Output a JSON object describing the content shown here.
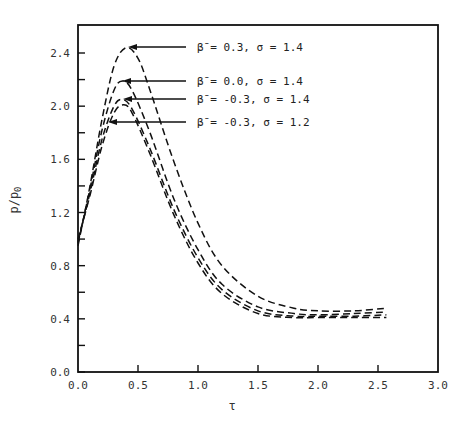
{
  "chart_data": {
    "type": "line",
    "title": "",
    "xlabel": "τ",
    "ylabel": "p/p0",
    "xlim": [
      0.0,
      3.0
    ],
    "ylim": [
      0.0,
      2.6
    ],
    "grid": false,
    "legend_position": "annotations with arrows, upper right",
    "x_ticks": [
      "0.0",
      "0.5",
      "1.0",
      "1.5",
      "2.0",
      "2.5",
      "3.0"
    ],
    "y_ticks": [
      "0.0",
      "0.4",
      "0.8",
      "1.2",
      "1.6",
      "2.0",
      "2.4"
    ],
    "line_style": "dashed",
    "series": [
      {
        "name": "β̄ = 0.3, σ = 1.4",
        "beta": 0.3,
        "sigma": 1.4,
        "x": [
          0.0,
          0.1,
          0.2,
          0.3,
          0.4,
          0.5,
          0.6,
          0.8,
          1.0,
          1.2,
          1.5,
          1.8,
          2.0,
          2.3,
          2.57
        ],
        "y": [
          0.95,
          1.4,
          1.9,
          2.3,
          2.44,
          2.36,
          2.12,
          1.58,
          1.12,
          0.8,
          0.57,
          0.48,
          0.46,
          0.46,
          0.48
        ]
      },
      {
        "name": "β̄ = 0.0, σ = 1.4",
        "beta": 0.0,
        "sigma": 1.4,
        "x": [
          0.0,
          0.1,
          0.2,
          0.3,
          0.37,
          0.45,
          0.6,
          0.8,
          1.0,
          1.2,
          1.5,
          1.8,
          2.0,
          2.3,
          2.57
        ],
        "y": [
          0.97,
          1.38,
          1.82,
          2.12,
          2.19,
          2.12,
          1.8,
          1.3,
          0.92,
          0.66,
          0.49,
          0.44,
          0.43,
          0.44,
          0.45
        ]
      },
      {
        "name": "β̄ = -0.3, σ = 1.4",
        "beta": -0.3,
        "sigma": 1.4,
        "x": [
          0.0,
          0.1,
          0.2,
          0.3,
          0.37,
          0.45,
          0.6,
          0.8,
          1.0,
          1.2,
          1.5,
          1.8,
          2.0,
          2.3,
          2.57
        ],
        "y": [
          0.98,
          1.35,
          1.75,
          2.0,
          2.05,
          1.98,
          1.68,
          1.22,
          0.86,
          0.62,
          0.46,
          0.42,
          0.42,
          0.42,
          0.43
        ]
      },
      {
        "name": "β̄ = -0.3, σ = 1.2",
        "beta": -0.3,
        "sigma": 1.2,
        "x": [
          0.0,
          0.1,
          0.2,
          0.3,
          0.38,
          0.45,
          0.6,
          0.8,
          1.0,
          1.2,
          1.5,
          1.8,
          2.0,
          2.3,
          2.57
        ],
        "y": [
          1.0,
          1.33,
          1.7,
          1.95,
          2.01,
          1.95,
          1.64,
          1.18,
          0.82,
          0.59,
          0.44,
          0.41,
          0.41,
          0.41,
          0.41
        ]
      }
    ],
    "annotations": [
      {
        "text": "β̄ = 0.3, σ = 1.4",
        "arrow_to": [
          0.42,
          2.44
        ]
      },
      {
        "text": "β̄ = 0.0, σ = 1.4",
        "arrow_to": [
          0.37,
          2.19
        ]
      },
      {
        "text": "β̄ = -0.3, σ = 1.4",
        "arrow_to": [
          0.37,
          2.05
        ]
      },
      {
        "text": "β̄ = -0.3, σ = 1.2",
        "arrow_to": [
          0.3,
          1.88
        ]
      }
    ]
  },
  "labels": {
    "x_axis": "τ",
    "y_axis": "p/p",
    "y_axis_sub": "0",
    "legend": [
      "β̄ = 0.3, σ = 1.4",
      "β̄ = 0.0, σ = 1.4",
      "β̄ = -0.3, σ = 1.4",
      "β̄ = -0.3, σ = 1.2"
    ],
    "x_ticks": [
      "0.0",
      "0.5",
      "1.0",
      "1.5",
      "2.0",
      "2.5",
      "3.0"
    ],
    "y_ticks": [
      "0.0",
      "0.4",
      "0.8",
      "1.2",
      "1.6",
      "2.0",
      "2.4"
    ]
  }
}
